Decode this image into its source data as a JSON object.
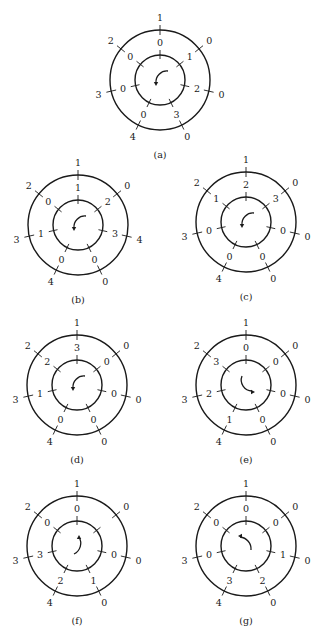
{
  "figure": {
    "positions_per_ring": 7,
    "panels": [
      {
        "id": "a",
        "caption": "(a)",
        "center": [
          160,
          80
        ],
        "outer": [
          "1",
          "0",
          "0",
          "0",
          "4",
          "3",
          "2"
        ],
        "inner": [
          "0",
          "1",
          "2",
          "3",
          "0",
          "0",
          "0"
        ],
        "arrow": "counterclockwise"
      },
      {
        "id": "b",
        "caption": "(b)",
        "center": [
          78,
          225
        ],
        "outer": [
          "1",
          "0",
          "4",
          "0",
          "4",
          "3",
          "2"
        ],
        "inner": [
          "1",
          "2",
          "3",
          "0",
          "0",
          "1",
          "0"
        ],
        "arrow": "counterclockwise"
      },
      {
        "id": "c",
        "caption": "(c)",
        "center": [
          246,
          222
        ],
        "outer": [
          "1",
          "0",
          "0",
          "0",
          "4",
          "3",
          "2"
        ],
        "inner": [
          "2",
          "3",
          "0",
          "0",
          "0",
          "0",
          "1"
        ],
        "arrow": "counterclockwise"
      },
      {
        "id": "d",
        "caption": "(d)",
        "center": [
          77,
          385
        ],
        "outer": [
          "1",
          "0",
          "0",
          "0",
          "4",
          "3",
          "2"
        ],
        "inner": [
          "3",
          "0",
          "0",
          "0",
          "0",
          "1",
          "2"
        ],
        "arrow": "counterclockwise"
      },
      {
        "id": "e",
        "caption": "(e)",
        "center": [
          246,
          385
        ],
        "outer": [
          "1",
          "0",
          "0",
          "0",
          "4",
          "3",
          "2"
        ],
        "inner": [
          "0",
          "0",
          "0",
          "0",
          "1",
          "2",
          "3"
        ],
        "arrow": "clockwise-hook"
      },
      {
        "id": "f",
        "caption": "(f)",
        "center": [
          77,
          546
        ],
        "outer": [
          "1",
          "0",
          "0",
          "0",
          "4",
          "3",
          "2"
        ],
        "inner": [
          "0",
          "",
          "0",
          "1",
          "2",
          "3",
          "0"
        ],
        "arrow": "clockwise"
      },
      {
        "id": "g",
        "caption": "(g)",
        "center": [
          246,
          546
        ],
        "outer": [
          "1",
          "0",
          "0",
          "0",
          "4",
          "3",
          "2"
        ],
        "inner": [
          "0",
          "0",
          "1",
          "2",
          "3",
          "0",
          "0"
        ],
        "arrow": "clockwise"
      }
    ]
  }
}
